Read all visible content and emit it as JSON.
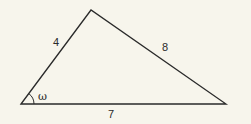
{
  "diagram": {
    "type": "triangle",
    "vertices": {
      "left": [
        21,
        104
      ],
      "top": [
        91,
        10
      ],
      "right": [
        226,
        104
      ]
    },
    "sides": [
      {
        "name": "left-side",
        "from": "left",
        "to": "top",
        "label": "4"
      },
      {
        "name": "right-side",
        "from": "top",
        "to": "right",
        "label": "8"
      },
      {
        "name": "base",
        "from": "left",
        "to": "right",
        "label": "7"
      }
    ],
    "angle": {
      "vertex": "left",
      "label": "ω"
    },
    "colors": {
      "stroke": "#2a2a2a",
      "background": "#f7f5ec"
    }
  }
}
